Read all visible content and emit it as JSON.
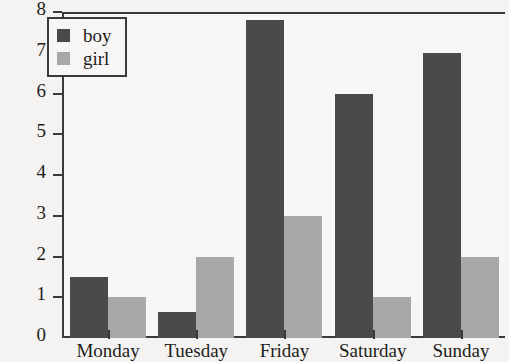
{
  "chart_data": {
    "type": "bar",
    "title": "",
    "xlabel": "",
    "ylabel": "",
    "categories": [
      "Monday",
      "Tuesday",
      "Friday",
      "Saturday",
      "Sunday"
    ],
    "series": [
      {
        "name": "boy",
        "color": "#4a4a4a",
        "values": [
          1.5,
          0.65,
          7.8,
          6.0,
          7.0
        ]
      },
      {
        "name": "girl",
        "color": "#a8a8a8",
        "values": [
          1.0,
          2.0,
          3.0,
          1.0,
          2.0
        ]
      }
    ],
    "ylim": [
      0,
      8
    ],
    "yticks": [
      0,
      1,
      2,
      3,
      4,
      5,
      6,
      7,
      8
    ],
    "ytick_labels": [
      "0",
      "1",
      "2",
      "3",
      "4",
      "5",
      "6",
      "7",
      "8"
    ],
    "grid": false,
    "legend_position": "top-left",
    "background_color": "#f4f3f1",
    "axis_color": "#3a3a38"
  },
  "legend": {
    "entries": [
      {
        "label": "boy"
      },
      {
        "label": "girl"
      }
    ]
  }
}
